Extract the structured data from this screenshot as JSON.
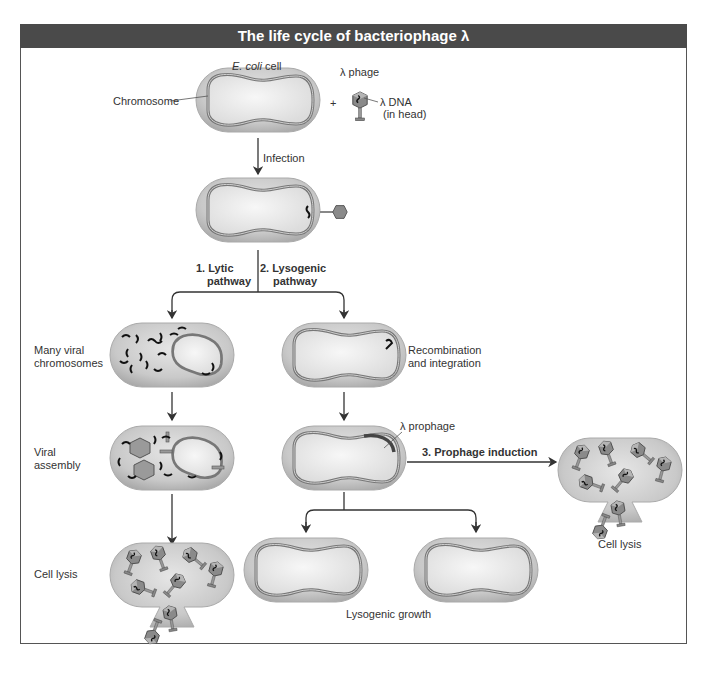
{
  "title": "The life cycle of bacteriophage λ",
  "labels": {
    "ecoli_cell": "cell",
    "ecoli_italic": "E. coli",
    "chromosome": "Chromosome",
    "lambda_phage": "λ phage",
    "plus": "+",
    "lambda_dna": "λ DNA",
    "in_head": "(in head)",
    "infection": "Infection",
    "lytic_1": "1. Lytic",
    "lytic_2": "pathway",
    "lysogenic_1": "2. Lysogenic",
    "lysogenic_2": "pathway",
    "many_viral_1": "Many viral",
    "many_viral_2": "chromosomes",
    "recomb_1": "Recombination",
    "recomb_2": "and integration",
    "viral_assembly_1": "Viral",
    "viral_assembly_2": "assembly",
    "prophage": "λ prophage",
    "prophage_induction": "3. Prophage induction",
    "cell_lysis_left": "Cell lysis",
    "cell_lysis_right": "Cell lysis",
    "lysogenic_growth": "Lysogenic growth"
  },
  "colors": {
    "title_bg": "#4a4a4a",
    "cell_fill": "#c8c8c8",
    "cell_inner": "#ececec",
    "dna": "#222222",
    "arrow": "#333333"
  }
}
